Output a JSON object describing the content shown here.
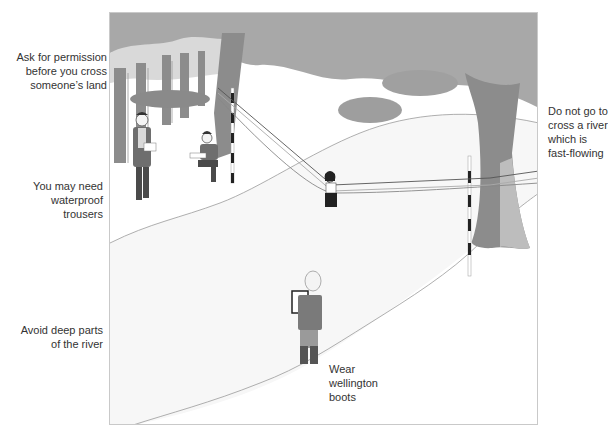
{
  "figure": {
    "colors": {
      "foliage": "#a8a8a8",
      "tree_trunk": "#8c8c8c",
      "tree_light": "#bdbdbd",
      "river_bank": "#f4f4f4",
      "outline": "#9a9a9a",
      "pole_dark": "#222222",
      "clothing": "#6e6e6e",
      "text": "#333333",
      "frame": "#c9c9c9"
    }
  },
  "annotations": {
    "left": [
      {
        "id": "permission",
        "lines": [
          "Ask for permission",
          "before you cross",
          "someone’s land"
        ]
      },
      {
        "id": "trousers",
        "lines": [
          "You may need",
          "waterproof",
          "trousers"
        ]
      },
      {
        "id": "deep_parts",
        "lines": [
          "Avoid deep parts",
          "of the river"
        ]
      }
    ],
    "right": [
      {
        "id": "fast_flowing",
        "lines": [
          "Do not go to",
          "cross a river",
          "which is",
          "fast-flowing"
        ]
      }
    ],
    "inline": [
      {
        "id": "wellingtons",
        "lines": [
          "Wear",
          "wellington",
          "boots"
        ]
      }
    ]
  }
}
